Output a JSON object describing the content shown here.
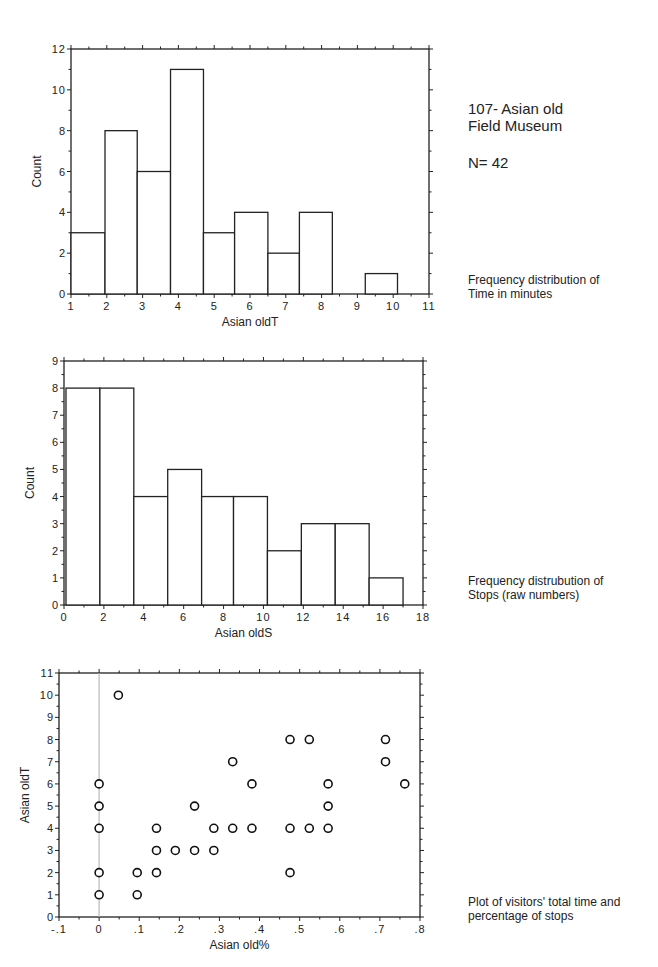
{
  "header": {
    "title_line1": "107- Asian old",
    "title_line2": "Field Museum",
    "n_label": "N= 42"
  },
  "notes": {
    "time_line1": "Frequency distribution of",
    "time_line2": "Time in minutes",
    "stops_line1": "Frequency distrubution of",
    "stops_line2": "Stops (raw numbers)",
    "scatter_line1": "Plot of visitors' total time and",
    "scatter_line2": "percentage of stops"
  },
  "chart_data": [
    {
      "type": "bar",
      "title": "Frequency distribution of Time in minutes",
      "xlabel": "Asian oldT",
      "ylabel": "Count",
      "xlim": [
        1,
        11
      ],
      "ylim": [
        0,
        12
      ],
      "xticks": [
        1,
        2,
        3,
        4,
        5,
        6,
        7,
        8,
        9,
        10,
        11
      ],
      "yticks": [
        0,
        2,
        4,
        6,
        8,
        10,
        12
      ],
      "bins": [
        {
          "x0": 1.0,
          "x1": 1.95,
          "count": 3
        },
        {
          "x0": 1.95,
          "x1": 2.85,
          "count": 8
        },
        {
          "x0": 2.85,
          "x1": 3.78,
          "count": 6
        },
        {
          "x0": 3.78,
          "x1": 4.7,
          "count": 11
        },
        {
          "x0": 4.7,
          "x1": 5.57,
          "count": 3
        },
        {
          "x0": 5.57,
          "x1": 6.5,
          "count": 4
        },
        {
          "x0": 6.5,
          "x1": 7.38,
          "count": 2
        },
        {
          "x0": 7.38,
          "x1": 8.3,
          "count": 4
        },
        {
          "x0": 8.3,
          "x1": 9.22,
          "count": 0
        },
        {
          "x0": 9.22,
          "x1": 10.12,
          "count": 1
        }
      ],
      "grid": false
    },
    {
      "type": "bar",
      "title": "Frequency distrubution of Stops (raw numbers)",
      "xlabel": "Asian oldS",
      "ylabel": "Count",
      "xlim": [
        0,
        18
      ],
      "ylim": [
        0,
        9
      ],
      "xticks": [
        0,
        2,
        4,
        6,
        8,
        10,
        12,
        14,
        16,
        18
      ],
      "yticks": [
        0,
        1,
        2,
        3,
        4,
        5,
        6,
        7,
        8,
        9
      ],
      "bins": [
        {
          "x0": 0.1,
          "x1": 1.8,
          "count": 8
        },
        {
          "x0": 1.8,
          "x1": 3.5,
          "count": 8
        },
        {
          "x0": 3.5,
          "x1": 5.2,
          "count": 4
        },
        {
          "x0": 5.2,
          "x1": 6.9,
          "count": 5
        },
        {
          "x0": 6.9,
          "x1": 8.5,
          "count": 4
        },
        {
          "x0": 8.5,
          "x1": 10.2,
          "count": 4
        },
        {
          "x0": 10.2,
          "x1": 11.9,
          "count": 2
        },
        {
          "x0": 11.9,
          "x1": 13.6,
          "count": 3
        },
        {
          "x0": 13.6,
          "x1": 15.3,
          "count": 3
        },
        {
          "x0": 15.3,
          "x1": 17.0,
          "count": 1
        }
      ],
      "grid": false
    },
    {
      "type": "scatter",
      "title": "Plot of visitors' total time and percentage of stops",
      "xlabel": "Asian old%",
      "ylabel": "Asian oldT",
      "xlim": [
        -0.1,
        0.8
      ],
      "ylim": [
        0,
        11
      ],
      "xticks": [
        "-.1",
        "0",
        ".1",
        ".2",
        ".3",
        ".4",
        ".5",
        ".6",
        ".7",
        ".8"
      ],
      "yticks": [
        0,
        1,
        2,
        3,
        4,
        5,
        6,
        7,
        8,
        9,
        10,
        11
      ],
      "reference_line_x": 0,
      "points": [
        [
          0,
          1
        ],
        [
          0,
          2
        ],
        [
          0,
          4
        ],
        [
          0,
          5
        ],
        [
          0,
          6
        ],
        [
          0.048,
          10
        ],
        [
          0.095,
          1
        ],
        [
          0.095,
          2
        ],
        [
          0.143,
          2
        ],
        [
          0.143,
          3
        ],
        [
          0.143,
          4
        ],
        [
          0.19,
          3
        ],
        [
          0.238,
          3
        ],
        [
          0.238,
          5
        ],
        [
          0.286,
          3
        ],
        [
          0.286,
          4
        ],
        [
          0.333,
          4
        ],
        [
          0.333,
          7
        ],
        [
          0.381,
          4
        ],
        [
          0.381,
          6
        ],
        [
          0.476,
          2
        ],
        [
          0.476,
          4
        ],
        [
          0.476,
          8
        ],
        [
          0.524,
          4
        ],
        [
          0.524,
          8
        ],
        [
          0.571,
          4
        ],
        [
          0.571,
          5
        ],
        [
          0.571,
          6
        ],
        [
          0.714,
          7
        ],
        [
          0.714,
          8
        ],
        [
          0.762,
          6
        ]
      ],
      "grid": false
    }
  ]
}
